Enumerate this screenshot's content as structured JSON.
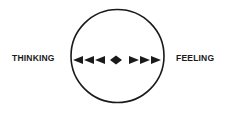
{
  "diagram": {
    "left_label": "THINKING",
    "right_label": "FEELING",
    "circle": {
      "stroke": "#1a1a1a"
    },
    "arrows": {
      "left_count": 3,
      "right_count": 3,
      "center": "diamond",
      "color": "#1a1a1a"
    }
  }
}
